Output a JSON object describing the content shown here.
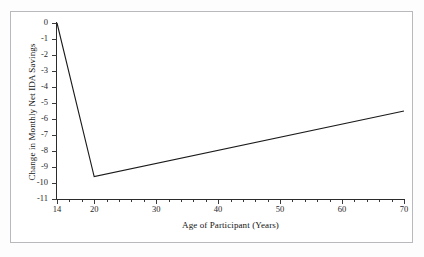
{
  "figure": {
    "clipped_caption_above": "",
    "background_color": "#ffffff",
    "frame_color": "#b9b9bd",
    "axis_color": "#2b2b2b",
    "line_color": "#1a1a1a"
  },
  "chart_data": {
    "type": "line",
    "title": "",
    "xlabel": "Age of Participant (Years)",
    "ylabel": "Change in Monthly Net IDA Savings",
    "xlim": [
      14,
      70
    ],
    "ylim": [
      -11,
      0
    ],
    "grid": false,
    "legend": false,
    "x_ticks": [
      14,
      20,
      30,
      40,
      50,
      60,
      70
    ],
    "x_tick_labels": [
      "14",
      "20",
      "30",
      "40",
      "50",
      "60",
      "70"
    ],
    "x_minor_tick_step": 2,
    "y_ticks": [
      0,
      -1,
      -2,
      -3,
      -4,
      -5,
      -6,
      -7,
      -8,
      -9,
      -10,
      -11
    ],
    "y_tick_labels": [
      "0",
      "-1",
      "-2",
      "-3",
      "-4",
      "-5",
      "-6",
      "-7",
      "-8",
      "-9",
      "-10",
      "-11"
    ],
    "series": [
      {
        "name": "Change in Monthly Net IDA Savings",
        "color": "#1a1a1a",
        "x": [
          14,
          20,
          70
        ],
        "y": [
          0,
          -9.6,
          -5.5
        ]
      }
    ]
  }
}
